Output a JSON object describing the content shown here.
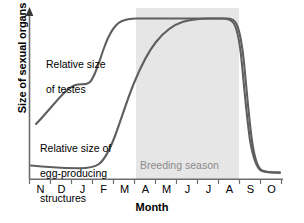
{
  "figure": {
    "background_color": "#ffffff",
    "curve_color": "#5f5f5f",
    "axis_color": "#6e6e6e",
    "band_color": "#e6e6e6",
    "band_label_color": "#8a8a8a"
  },
  "chart_data": {
    "type": "line",
    "title": "",
    "xlabel": "Month",
    "ylabel": "Size of sexual organs",
    "x": [
      "N",
      "D",
      "J",
      "F",
      "M",
      "A",
      "M",
      "J",
      "J",
      "A",
      "S",
      "O"
    ],
    "categories": [
      "N",
      "D",
      "J",
      "F",
      "M",
      "A",
      "M",
      "J",
      "J",
      "A",
      "S",
      "O"
    ],
    "xlim": [
      0,
      11
    ],
    "ylim": [
      0,
      1
    ],
    "grid": false,
    "legend_position": "inline-annotation",
    "axis_tick_labels_y": [],
    "series": [
      {
        "name": "Relative size of testes",
        "label": "Relative size of\nof testes",
        "color": "#5f5f5f",
        "values": [
          0.28,
          0.42,
          0.46,
          0.52,
          0.82,
          0.97,
          0.98,
          0.98,
          0.98,
          0.97,
          0.06,
          0.03
        ]
      },
      {
        "name": "Relative size of egg-producing structures",
        "label": "Relative size of\negg-producing\nstructures",
        "color": "#5f5f5f",
        "values": [
          0.07,
          0.06,
          0.05,
          0.05,
          0.12,
          0.42,
          0.7,
          0.9,
          0.97,
          0.97,
          0.1,
          0.03
        ]
      }
    ],
    "annotations": [
      {
        "name": "breeding-season-band",
        "text": "Breeding season",
        "type": "shaded-x-band",
        "x_start": "mid-March",
        "x_end": "early-August",
        "color": "#e6e6e6"
      }
    ]
  },
  "labels": {
    "y_axis_title": "Size of sexual organs",
    "x_axis_title": "Month",
    "testes_line1": "Relative size",
    "testes_line2": "of testes",
    "egg_line1": "Relative size of",
    "egg_line2": "egg-producing",
    "egg_line3": "structures",
    "breeding_season": "Breeding season"
  },
  "ticks": {
    "x": [
      "N",
      "D",
      "J",
      "F",
      "M",
      "A",
      "M",
      "J",
      "J",
      "A",
      "S",
      "O"
    ]
  }
}
